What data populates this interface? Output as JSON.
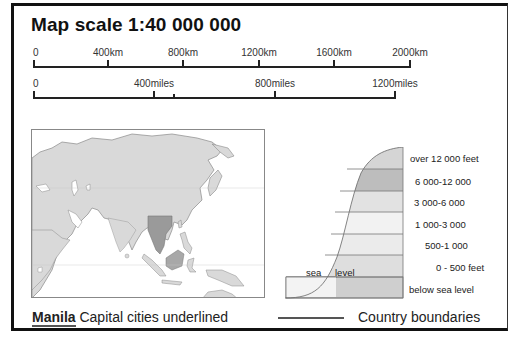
{
  "title": "Map scale 1:40 000 000",
  "scale_km": {
    "labels": [
      "0",
      "400km",
      "800km",
      "1200km",
      "1600km",
      "2000km"
    ],
    "positions": [
      0,
      75,
      150,
      226,
      301,
      377
    ]
  },
  "scale_miles": {
    "labels": [
      "0",
      "400miles",
      "800miles",
      "1200miles"
    ],
    "positions": [
      0,
      121,
      242,
      362
    ],
    "extra_tick": 140
  },
  "map": {
    "region": "Asia and Western Pacific",
    "highlight_region": "Indochina",
    "colors": {
      "land": "#d9d9d9",
      "highlight": "#9a9a9a",
      "sea": "#ffffff",
      "border": "#8a8a8a"
    }
  },
  "elevation_key": {
    "bands": [
      {
        "label": "over 12 000 feet",
        "color": "#d5d5d5"
      },
      {
        "label": "6 000-12 000",
        "color": "#bdbdbd"
      },
      {
        "label": "3 000-6 000",
        "color": "#e2e2e2"
      },
      {
        "label": "1 000-3 000",
        "color": "#f2f2f2"
      },
      {
        "label": "500-1 000",
        "color": "#ebebeb"
      },
      {
        "label": "0 - 500 feet",
        "color": "#dedede"
      },
      {
        "label": "below sea level",
        "color": "#cfcfcf"
      }
    ],
    "sea_label": "sea",
    "level_label": "level"
  },
  "legend": {
    "capital_example": "Manila",
    "capital_text": "Capital cities underlined",
    "boundary_text": "Country boundaries"
  }
}
